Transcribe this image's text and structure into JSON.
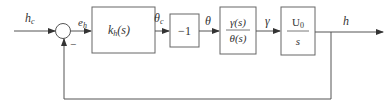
{
  "diagram": {
    "type": "feedback-block-diagram",
    "signals": {
      "input": "h",
      "input_sub": "c",
      "error": "e",
      "error_sub": "h",
      "theta_cmd": "θ",
      "theta_cmd_sub": "c",
      "theta": "θ",
      "gamma": "γ",
      "output": "h"
    },
    "summing_junction": {
      "feedback_sign": "−"
    },
    "blocks": [
      {
        "id": "controller",
        "label": "k",
        "label_sub": "h",
        "label_suffix": "(s)"
      },
      {
        "id": "gain",
        "label": "−1"
      },
      {
        "id": "transfer",
        "numerator": "γ(s)",
        "denominator": "θ(s)"
      },
      {
        "id": "integrator",
        "numerator": "U",
        "numerator_sub": "0",
        "denominator": "s"
      }
    ],
    "colors": {
      "stroke": "#555555",
      "text": "#333333",
      "background": "#ffffff"
    }
  }
}
